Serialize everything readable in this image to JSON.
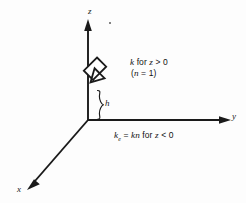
{
  "figure": {
    "background_color": "#fdfdfd",
    "line_color": "#1a1a1a",
    "axes": {
      "z": {
        "label": "z",
        "direction": "up"
      },
      "y": {
        "label": "y",
        "direction": "right"
      },
      "x": {
        "label": "x",
        "direction": "down-left"
      }
    },
    "brace": {
      "label": "h",
      "meaning": "height above origin along z axis"
    },
    "annotations": {
      "upper_line1": "k for z > 0",
      "upper_line1_parts": {
        "symbol": "k",
        "text_mid": " for ",
        "variable": "z",
        "relation": " > 0"
      },
      "upper_line2": "(n = 1)",
      "upper_line2_parts": {
        "open": "(",
        "variable": "n",
        "relation": " = 1",
        "close": ")"
      },
      "bottom": "ke = kn for z < 0",
      "bottom_parts": {
        "symbol": "k",
        "subscript": "e",
        "equals": " = ",
        "expression": "kn",
        "text_mid": " for ",
        "variable": "z",
        "relation": " < 0"
      }
    },
    "arrow": {
      "style": "hollow-block-arrow",
      "direction": "down-left",
      "points_to": "z-axis"
    }
  }
}
